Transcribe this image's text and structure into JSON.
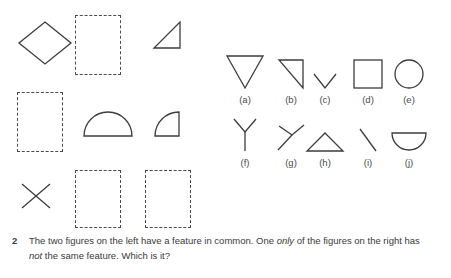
{
  "page": {
    "background_color": "#ffffff",
    "stroke_color": "#3c3c3c",
    "text_color": "#3a3a3a"
  },
  "question": {
    "number": "2",
    "text_part_1": "The two figures on the left have a feature in common. One ",
    "emphasis_1": "only",
    "text_part_2": " of the figures on the right has ",
    "emphasis_2": "not",
    "text_part_3": " the same feature. Which is it?",
    "full_text": "The two figures on the left have a feature in common. One only of the figures on the right has not the same feature. Which is it?"
  },
  "left_panel": {
    "description": "Three-by-three grid mixing drawn line figures with empty dashed placeholder rectangles",
    "cells": [
      {
        "id": "cell-r1c1",
        "kind": "shape",
        "shape": "diamond",
        "label": ""
      },
      {
        "id": "cell-r1c2",
        "kind": "placeholder",
        "shape": "dashed-rectangle",
        "label": ""
      },
      {
        "id": "cell-r1c3",
        "kind": "shape",
        "shape": "right-triangle",
        "label": ""
      },
      {
        "id": "cell-r2c1",
        "kind": "placeholder",
        "shape": "dashed-rectangle",
        "label": ""
      },
      {
        "id": "cell-r2c2",
        "kind": "shape",
        "shape": "semicircle-flat-down",
        "label": ""
      },
      {
        "id": "cell-r2c3",
        "kind": "shape",
        "shape": "quarter-circle",
        "label": ""
      },
      {
        "id": "cell-r3c1",
        "kind": "shape",
        "shape": "cross-x",
        "label": ""
      },
      {
        "id": "cell-r3c2",
        "kind": "placeholder",
        "shape": "dashed-rectangle",
        "label": ""
      },
      {
        "id": "cell-r3c3",
        "kind": "placeholder",
        "shape": "dashed-rectangle",
        "label": ""
      }
    ]
  },
  "right_panel": {
    "description": "Ten lettered answer options arranged in two rows of five",
    "options": [
      {
        "letter": "(a)",
        "shape": "triangle-pointing-down",
        "name": "option-a"
      },
      {
        "letter": "(b)",
        "shape": "right-triangle",
        "name": "option-b"
      },
      {
        "letter": "(c)",
        "shape": "chevron-v",
        "name": "option-c"
      },
      {
        "letter": "(d)",
        "shape": "square",
        "name": "option-d"
      },
      {
        "letter": "(e)",
        "shape": "circle",
        "name": "option-e"
      },
      {
        "letter": "(f)",
        "shape": "y-upright",
        "name": "option-f"
      },
      {
        "letter": "(g)",
        "shape": "y-rotated",
        "name": "option-g"
      },
      {
        "letter": "(h)",
        "shape": "triangle-pointing-up",
        "name": "option-h"
      },
      {
        "letter": "(i)",
        "shape": "diagonal-line",
        "name": "option-i"
      },
      {
        "letter": "(j)",
        "shape": "semicircle-flat-up",
        "name": "option-j"
      }
    ]
  }
}
